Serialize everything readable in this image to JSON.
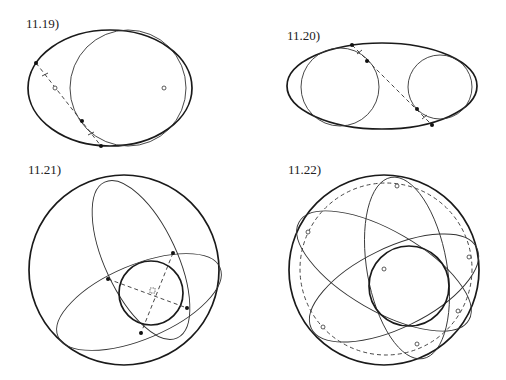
{
  "figure": {
    "panels": [
      {
        "id": "11.19",
        "label": "11.19)",
        "description": "Outer ellipse with an internally tangent circle; dashed chord through tangency with filled points and open focus markers",
        "outer_ellipse": {
          "cx": 110,
          "cy": 88,
          "rx": 82,
          "ry": 58
        },
        "inner_circle": {
          "cx": 128,
          "cy": 88,
          "r": 58
        },
        "open_points": [
          [
            164,
            88
          ],
          [
            55,
            88
          ]
        ],
        "filled_points": [
          [
            36,
            63
          ],
          [
            82,
            121
          ],
          [
            101,
            146
          ]
        ],
        "dashed_line": [
          [
            36,
            63
          ],
          [
            101,
            146
          ]
        ]
      },
      {
        "id": "11.20",
        "label": "11.20)",
        "description": "Outer ellipse containing two internally tangent circles with a dashed common tangent",
        "outer_ellipse": {
          "cx": 382,
          "cy": 86,
          "rx": 95,
          "ry": 43
        },
        "circles": [
          {
            "cx": 340,
            "cy": 87,
            "r": 39
          },
          {
            "cx": 440,
            "cy": 87,
            "r": 32
          }
        ],
        "filled_points": [
          [
            352,
            45
          ],
          [
            367,
            61
          ],
          [
            417,
            109
          ],
          [
            432,
            125
          ]
        ],
        "dashed_line": [
          [
            352,
            45
          ],
          [
            432,
            125
          ]
        ]
      },
      {
        "id": "11.21",
        "label": "11.21)",
        "description": "Large circle with two inscribed ellipses tangent to a small inner circle; perpendicular dashed chords",
        "outer_circle": {
          "cx": 124,
          "cy": 270,
          "r": 95
        },
        "inner_circle": {
          "cx": 151,
          "cy": 293,
          "r": 32
        },
        "ellipses": [
          {
            "cx": 141,
            "cy": 260,
            "rx": 36,
            "ry": 86,
            "rotate": -25
          },
          {
            "cx": 139,
            "cy": 302,
            "rx": 88,
            "ry": 37,
            "rotate": -23
          }
        ],
        "filled_points": [
          [
            108,
            279
          ],
          [
            173,
            253
          ],
          [
            187,
            308
          ],
          [
            141,
            333
          ]
        ],
        "dashed_lines": [
          [
            [
              108,
              279
            ],
            [
              187,
              308
            ]
          ],
          [
            [
              173,
              253
            ],
            [
              141,
              333
            ]
          ]
        ]
      },
      {
        "id": "11.22",
        "label": "11.22)",
        "description": "Large circle with dashed concentric circle, three ellipses tangent to inner circle, open markers on dashed circle",
        "outer_circle": {
          "cx": 384,
          "cy": 270,
          "r": 95
        },
        "dashed_circle": {
          "cx": 386,
          "cy": 269,
          "r": 86
        },
        "inner_circle": {
          "cx": 409,
          "cy": 286,
          "r": 40
        },
        "center_marker": [
          384,
          269
        ],
        "ellipses": [
          {
            "cx": 407,
            "cy": 268,
            "rx": 40,
            "ry": 92,
            "rotate": -10
          },
          {
            "cx": 384,
            "cy": 271,
            "rx": 98,
            "ry": 40,
            "rotate": 30
          },
          {
            "cx": 394,
            "cy": 288,
            "rx": 92,
            "ry": 40,
            "rotate": -26
          }
        ],
        "open_points": [
          [
            397,
            186
          ],
          [
            308,
            232
          ],
          [
            469,
            257
          ],
          [
            458,
            311
          ],
          [
            323,
            327
          ],
          [
            417,
            344
          ]
        ]
      }
    ]
  }
}
